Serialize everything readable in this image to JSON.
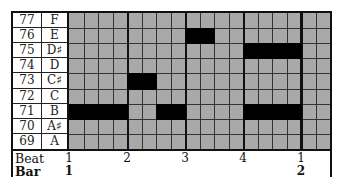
{
  "piano_roll": {
    "rows": [
      {
        "midi": "77",
        "note": "F"
      },
      {
        "midi": "76",
        "note": "E"
      },
      {
        "midi": "75",
        "note": "D♯"
      },
      {
        "midi": "74",
        "note": "D"
      },
      {
        "midi": "73",
        "note": "C♯"
      },
      {
        "midi": "72",
        "note": "C"
      },
      {
        "midi": "71",
        "note": "B"
      },
      {
        "midi": "70",
        "note": "A♯"
      },
      {
        "midi": "69",
        "note": "A"
      }
    ],
    "columns": 18,
    "steps_per_beat": 4,
    "notes": [
      {
        "row": 1,
        "start": 8,
        "length": 2,
        "midi": "76"
      },
      {
        "row": 2,
        "start": 12,
        "length": 4,
        "midi": "75"
      },
      {
        "row": 4,
        "start": 4,
        "length": 2,
        "midi": "73"
      },
      {
        "row": 6,
        "start": 0,
        "length": 4,
        "midi": "71"
      },
      {
        "row": 6,
        "start": 6,
        "length": 2,
        "midi": "71"
      },
      {
        "row": 6,
        "start": 12,
        "length": 4,
        "midi": "71"
      }
    ],
    "footer": {
      "beat_label": "Beat",
      "bar_label": "Bar",
      "beats": [
        {
          "label": "1",
          "col": 0
        },
        {
          "label": "2",
          "col": 4
        },
        {
          "label": "3",
          "col": 8
        },
        {
          "label": "4",
          "col": 12
        },
        {
          "label": "1",
          "col": 16
        }
      ],
      "bars": [
        {
          "label": "1",
          "col": 0
        },
        {
          "label": "2",
          "col": 16
        }
      ]
    },
    "colors": {
      "grid": "#a9a9a9",
      "note": "#000000",
      "lines": "#333333"
    }
  }
}
